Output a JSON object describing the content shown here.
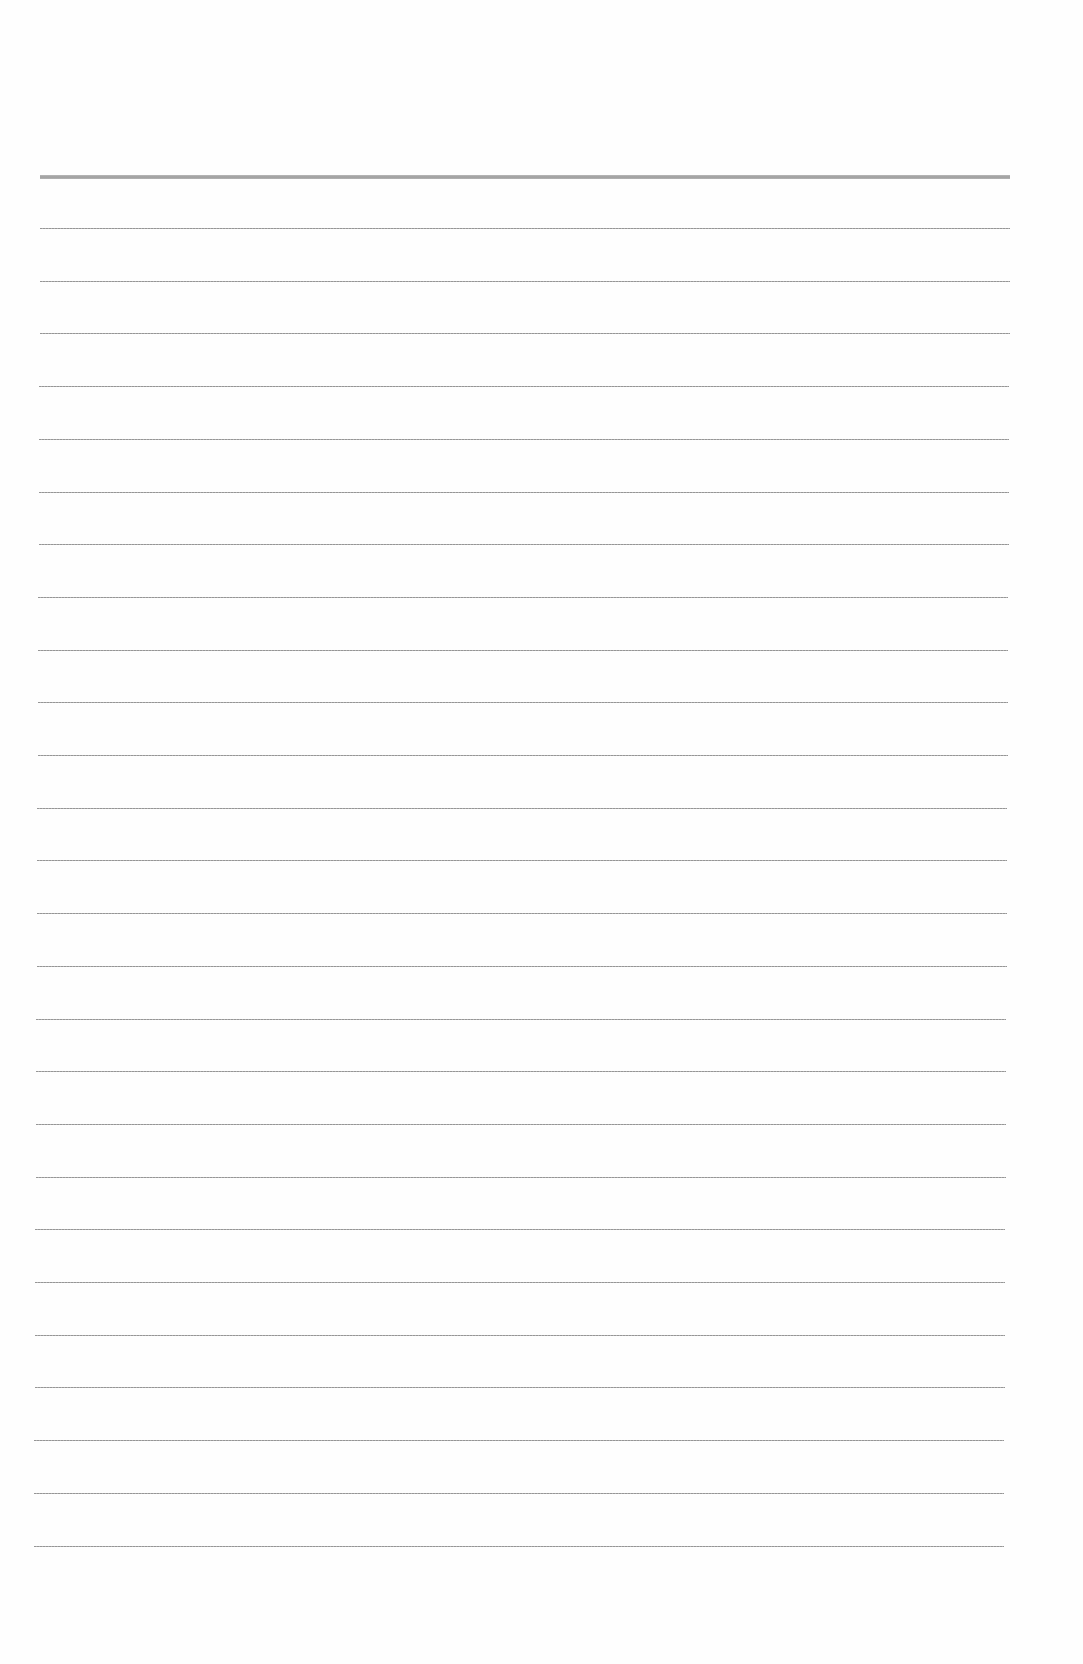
{
  "document": {
    "type": "ruled-paper",
    "background_color": "#fefefe",
    "rule_color": "#9a9a9a",
    "header_rule": {
      "y": 175,
      "x_start": 40,
      "x_end": 1010,
      "thickness": 4
    },
    "rules": {
      "count": 26,
      "first_y": 228,
      "spacing": 52.7,
      "x_start_top": 40,
      "x_start_bottom": 34,
      "x_end_top": 1010,
      "x_end_bottom": 1004,
      "thickness": 1
    },
    "text_content": []
  }
}
